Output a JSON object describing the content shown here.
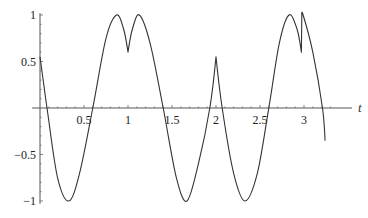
{
  "chart_data": {
    "type": "line",
    "title": "",
    "xlabel": "t",
    "ylabel": "",
    "xlim": [
      0,
      3.25
    ],
    "ylim": [
      -1,
      1
    ],
    "grid": false,
    "legend": null,
    "x_ticks": [
      0.5,
      1,
      1.5,
      2,
      2.5,
      3
    ],
    "x_tick_labels": [
      "0.5",
      "1",
      "1.5",
      "2",
      "2.5",
      "3"
    ],
    "y_ticks": [
      1,
      0.5,
      -0.5,
      -1
    ],
    "y_tick_labels": [
      "1",
      "0.5",
      "-0.5",
      "-1"
    ],
    "series": [
      {
        "name": "curve",
        "color": "#333333",
        "x": [
          0,
          0.08,
          0.2,
          0.33,
          0.45,
          0.6,
          0.75,
          0.87,
          0.95,
          1.0,
          1.05,
          1.13,
          1.25,
          1.4,
          1.55,
          1.67,
          1.8,
          1.93,
          2.0,
          2.07,
          2.2,
          2.33,
          2.47,
          2.6,
          2.72,
          2.83,
          2.92,
          2.97,
          2.975,
          2.99,
          3.1,
          3.21,
          3.24
        ],
        "y": [
          0.55,
          0,
          -0.75,
          -1,
          -0.7,
          0,
          0.75,
          1,
          0.85,
          0.6,
          0.85,
          1,
          0.7,
          0,
          -0.75,
          -1,
          -0.6,
          0,
          0.55,
          0,
          -0.7,
          -1,
          -0.7,
          0,
          0.7,
          1,
          0.85,
          0.6,
          1,
          1,
          0.6,
          0,
          -0.35
        ]
      }
    ]
  }
}
